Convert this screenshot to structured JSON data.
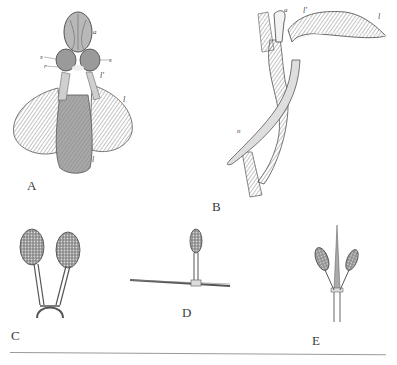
{
  "plate": {
    "figures": [
      {
        "id": "A",
        "label": "A",
        "description": "orchid flower, front view",
        "annotations": [
          "a",
          "s",
          "s",
          "r",
          "l'",
          "l",
          "l"
        ]
      },
      {
        "id": "B",
        "label": "B",
        "description": "orchid flower, side view with spur",
        "annotations": [
          "a",
          "l'",
          "l",
          "n"
        ]
      },
      {
        "id": "C",
        "label": "C",
        "description": "pair of pollinia on joined stalks"
      },
      {
        "id": "D",
        "label": "D",
        "description": "single pollinium attached to a needle"
      },
      {
        "id": "E",
        "label": "E",
        "description": "two pollinia on a pointed stalk"
      }
    ],
    "colors": {
      "ink": "#3a3a3a",
      "shade": "#7a7a7a",
      "paper": "#ffffff",
      "rule": "#9a9a9a"
    }
  }
}
